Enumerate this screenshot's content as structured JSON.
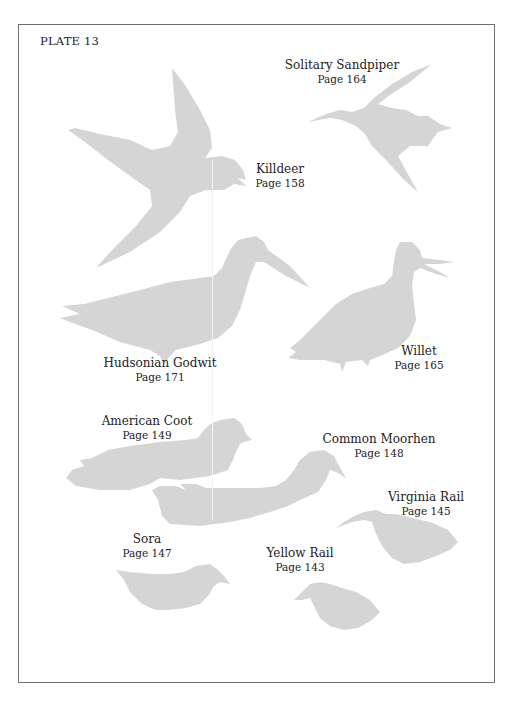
{
  "plate": {
    "title": "PLATE 13",
    "silhouette_color": "#d5d5d5",
    "frame_color": "#6f6f6f"
  },
  "birds": [
    {
      "name": "Solitary Sandpiper",
      "page": "Page 164"
    },
    {
      "name": "Killdeer",
      "page": "Page 158"
    },
    {
      "name": "Hudsonian Godwit",
      "page": "Page 171"
    },
    {
      "name": "Willet",
      "page": "Page 165"
    },
    {
      "name": "American Coot",
      "page": "Page 149"
    },
    {
      "name": "Common Moorhen",
      "page": "Page 148"
    },
    {
      "name": "Virginia Rail",
      "page": "Page 145"
    },
    {
      "name": "Sora",
      "page": "Page 147"
    },
    {
      "name": "Yellow Rail",
      "page": "Page 143"
    }
  ]
}
